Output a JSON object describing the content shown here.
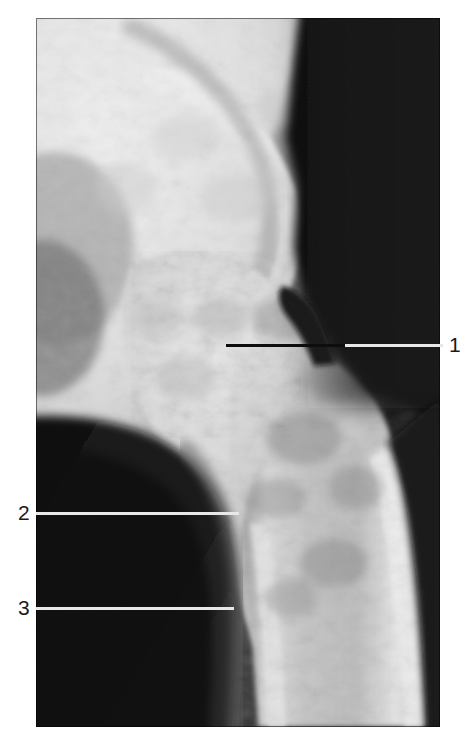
{
  "figure": {
    "kind": "radiograph",
    "modality": "X-ray",
    "view": "anteroposterior hip / proximal femur",
    "background_color": "#ffffff",
    "plate": {
      "x": 36,
      "y": 18,
      "width": 404,
      "height": 709,
      "dark_value": "#0a0a0a",
      "bright_value": "#f2f2f2"
    }
  },
  "annotations": {
    "labels": [
      {
        "id": "1",
        "text": "1",
        "side": "right",
        "text_x": 449,
        "text_y": 334,
        "line_y": 344,
        "segments": [
          {
            "style": "black",
            "x": 226,
            "width": 119,
            "color": "#0d0d0d"
          },
          {
            "style": "white",
            "x": 345,
            "width": 98,
            "color": "#e8e8e8"
          }
        ]
      },
      {
        "id": "2",
        "text": "2",
        "side": "left",
        "text_x": 18,
        "text_y": 502,
        "line_y": 512,
        "segments": [
          {
            "style": "white",
            "x": 36,
            "width": 203,
            "color": "#e8e8e8"
          }
        ]
      },
      {
        "id": "3",
        "text": "3",
        "side": "left",
        "text_x": 18,
        "text_y": 597,
        "line_y": 607,
        "segments": [
          {
            "style": "white",
            "x": 36,
            "width": 198,
            "color": "#e8e8e8"
          }
        ]
      }
    ]
  },
  "colors": {
    "page_background": "#ffffff",
    "label_text": "#1a1a1a",
    "leader_white": "#e8e8e8",
    "leader_black": "#0d0d0d",
    "film_black": "#0a0a0a",
    "bone_bright": "#f4f4f4"
  }
}
